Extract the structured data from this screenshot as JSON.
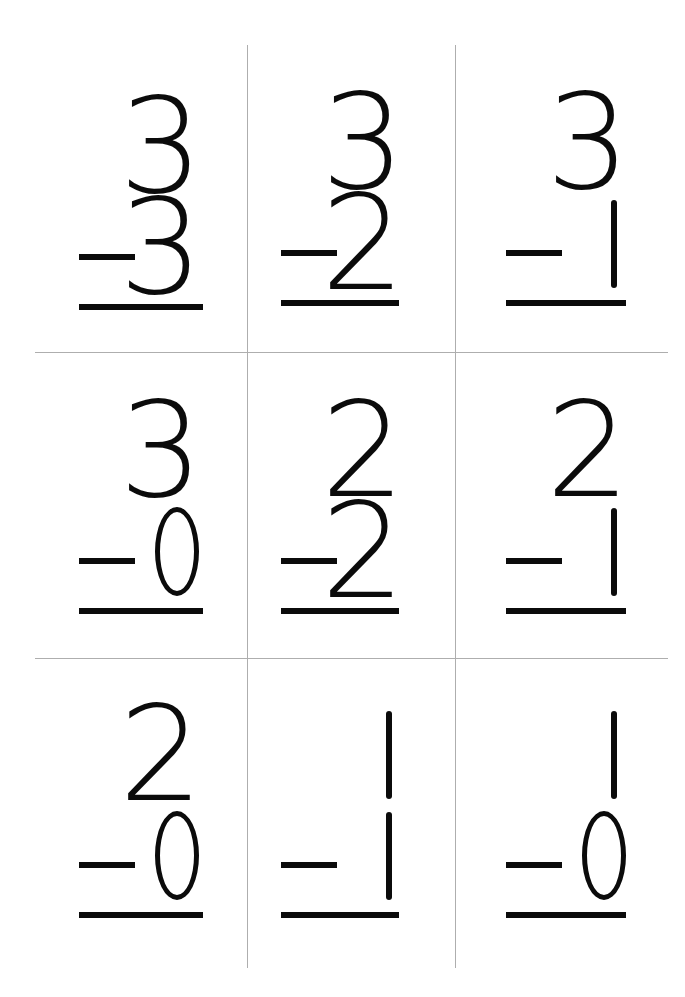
{
  "page": {
    "background_color": "#ffffff",
    "ink_color": "#0b0b0b",
    "guide_color": "#aeaeae",
    "width": 685,
    "height": 997
  },
  "worksheet": {
    "operator": "−",
    "columns": 3,
    "rows": 3,
    "problems": [
      {
        "id": "p1",
        "row": 1,
        "col": 1,
        "minuend": "3",
        "subtrahend": "3",
        "operator": "−",
        "answer": ""
      },
      {
        "id": "p2",
        "row": 1,
        "col": 2,
        "minuend": "3",
        "subtrahend": "2",
        "operator": "−",
        "answer": ""
      },
      {
        "id": "p3",
        "row": 1,
        "col": 3,
        "minuend": "3",
        "subtrahend": "1",
        "operator": "−",
        "answer": ""
      },
      {
        "id": "p4",
        "row": 2,
        "col": 1,
        "minuend": "3",
        "subtrahend": "0",
        "operator": "−",
        "answer": ""
      },
      {
        "id": "p5",
        "row": 2,
        "col": 2,
        "minuend": "2",
        "subtrahend": "2",
        "operator": "−",
        "answer": ""
      },
      {
        "id": "p6",
        "row": 2,
        "col": 3,
        "minuend": "2",
        "subtrahend": "1",
        "operator": "−",
        "answer": ""
      },
      {
        "id": "p7",
        "row": 3,
        "col": 1,
        "minuend": "2",
        "subtrahend": "0",
        "operator": "−",
        "answer": ""
      },
      {
        "id": "p8",
        "row": 3,
        "col": 2,
        "minuend": "1",
        "subtrahend": "1",
        "operator": "−",
        "answer": ""
      },
      {
        "id": "p9",
        "row": 3,
        "col": 3,
        "minuend": "1",
        "subtrahend": "0",
        "operator": "−",
        "answer": ""
      }
    ]
  }
}
